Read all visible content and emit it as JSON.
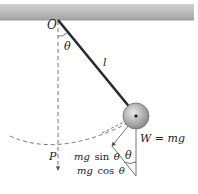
{
  "figure": {
    "type": "simple-pendulum-free-body-diagram",
    "labels": {
      "pivot": "O",
      "angle_top": "θ",
      "length": "l",
      "point": "P",
      "weight": "W = mg",
      "angle_bottom": "θ",
      "tangential_prefix": "mg",
      "tangential_fn": "sin",
      "tangential_var": "θ",
      "radial_prefix": "mg",
      "radial_fn": "cos",
      "radial_var": "θ"
    },
    "colors": {
      "ceiling": "#b9b9b9",
      "ceiling_edge": "#8d8d8d",
      "string": "#2a2a2a",
      "bob_fill": "#a8a8a8",
      "bob_highlight": "#e2e2e2",
      "lines": "#555555"
    }
  }
}
